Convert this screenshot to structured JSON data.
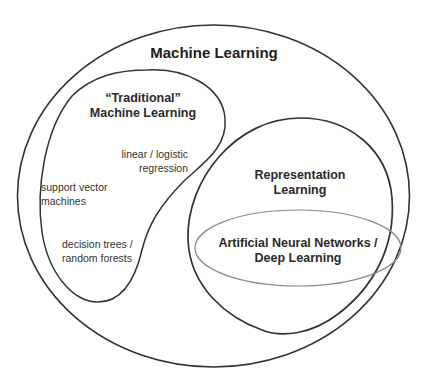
{
  "diagram": {
    "type": "nested-venn",
    "colors": {
      "stroke": "#333333",
      "inner_stroke": "#888888",
      "background": "#ffffff",
      "text": "#2a2a2a"
    },
    "regions": {
      "machine_learning": {
        "label": "Machine Learning"
      },
      "traditional_ml": {
        "label_line1": "“Traditional”",
        "label_line2": "Machine Learning",
        "items": [
          {
            "line1": "linear / logistic",
            "line2": "regression"
          },
          {
            "line1": "support vector",
            "line2": "machines"
          },
          {
            "line1": "decision trees /",
            "line2": "random forests"
          }
        ]
      },
      "representation_learning": {
        "label_line1": "Representation",
        "label_line2": "Learning"
      },
      "deep_learning": {
        "label_line1": "Artificial Neural Networks /",
        "label_line2": "Deep Learning"
      }
    }
  }
}
